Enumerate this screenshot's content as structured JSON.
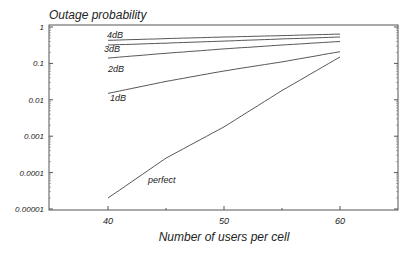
{
  "chart_data": {
    "type": "line",
    "title": "Outage probability",
    "xlabel": "Number of users per cell",
    "ylabel": "Outage probability",
    "yscale": "log",
    "xlim": [
      35,
      65
    ],
    "ylim": [
      1e-05,
      1
    ],
    "grid": false,
    "legend": "inline labels",
    "x_ticks": [
      40,
      50,
      60
    ],
    "x_tick_labels": [
      "40",
      "50",
      "60"
    ],
    "y_ticks": [
      1,
      0.1,
      0.01,
      0.001,
      0.0001,
      1e-05
    ],
    "y_tick_labels": [
      "1",
      "0.1",
      "0.01",
      "0.001",
      "0.0001",
      "0.00001"
    ],
    "x": [
      40,
      45,
      50,
      55,
      60
    ],
    "series": [
      {
        "name": "4dB",
        "values": [
          0.43,
          0.48,
          0.53,
          0.58,
          0.64
        ]
      },
      {
        "name": "3dB",
        "values": [
          0.32,
          0.36,
          0.41,
          0.47,
          0.53
        ]
      },
      {
        "name": "2dB",
        "values": [
          0.14,
          0.19,
          0.25,
          0.32,
          0.4
        ]
      },
      {
        "name": "1dB",
        "values": [
          0.015,
          0.032,
          0.062,
          0.11,
          0.21
        ]
      },
      {
        "name": "perfect",
        "values": [
          2e-05,
          0.00025,
          0.0018,
          0.018,
          0.15
        ]
      }
    ]
  }
}
